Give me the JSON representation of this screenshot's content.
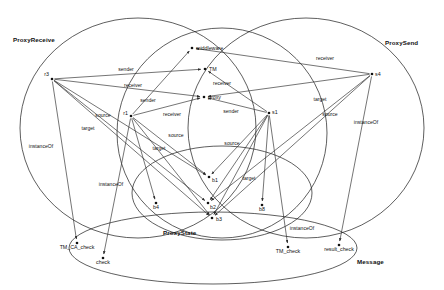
{
  "diagram": {
    "background_color": "#ffffff",
    "stroke_color": "#1a1a1a",
    "width": 444,
    "height": 290,
    "classes": [
      {
        "id": "proxyreceive",
        "label": "ProxyReceive",
        "cx": 138,
        "cy": 128,
        "rx": 118,
        "ry": 110,
        "label_x": 13,
        "label_y": 42
      },
      {
        "id": "proxysend",
        "label": "ProxySend",
        "cx": 306,
        "cy": 128,
        "rx": 118,
        "ry": 110,
        "label_x": 385,
        "label_y": 45
      },
      {
        "id": "middle_ring",
        "label": "",
        "cx": 222,
        "cy": 133,
        "rx": 105,
        "ry": 105,
        "label_x": 0,
        "label_y": 0
      },
      {
        "id": "proxystate",
        "label": "ProxyState",
        "cx": 222,
        "cy": 193,
        "rx": 90,
        "ry": 47,
        "label_x": 163,
        "label_y": 235
      },
      {
        "id": "message",
        "label": "Message",
        "cx": 213,
        "cy": 248,
        "rx": 144,
        "ry": 36,
        "label_x": 357,
        "label_y": 264
      }
    ],
    "nodes": [
      {
        "id": "r3",
        "label": "r3",
        "x": 52,
        "y": 79,
        "label_dx": -3,
        "label_dy": -3.5,
        "anchor": "end"
      },
      {
        "id": "r1",
        "label": "r1",
        "x": 131,
        "y": 116,
        "label_dx": -3,
        "label_dy": -1,
        "anchor": "end"
      },
      {
        "id": "s4",
        "label": "s4",
        "x": 372,
        "y": 74,
        "label_dx": 3,
        "label_dy": 2,
        "anchor": "start"
      },
      {
        "id": "s1",
        "label": "s1",
        "x": 269,
        "y": 113,
        "label_dx": 3,
        "label_dy": 1,
        "anchor": "start"
      },
      {
        "id": "middleware",
        "label": "middleware",
        "x": 192,
        "y": 48,
        "label_dx": 4,
        "label_dy": 2,
        "anchor": "start"
      },
      {
        "id": "tm",
        "label": "TM",
        "x": 205,
        "y": 69,
        "label_dx": 4,
        "label_dy": 2,
        "anchor": "start"
      },
      {
        "id": "proxy",
        "label": "proxy",
        "x": 204,
        "y": 97,
        "label_dx": 4,
        "label_dy": 2,
        "anchor": "start"
      },
      {
        "id": "b1",
        "label": "b1",
        "x": 209,
        "y": 177,
        "label_dx": 3,
        "label_dy": 5,
        "anchor": "start"
      },
      {
        "id": "b2",
        "label": "b2",
        "x": 208,
        "y": 203,
        "label_dx": 2,
        "label_dy": 5.5,
        "anchor": "start"
      },
      {
        "id": "b3",
        "label": "b3",
        "x": 212,
        "y": 218,
        "label_dx": 4,
        "label_dy": 3,
        "anchor": "start"
      },
      {
        "id": "b4",
        "label": "b4",
        "x": 156,
        "y": 203,
        "label_dx": 0,
        "label_dy": 6,
        "anchor": "middle"
      },
      {
        "id": "b8",
        "label": "b8",
        "x": 262,
        "y": 205,
        "label_dx": 0,
        "label_dy": 6,
        "anchor": "middle"
      },
      {
        "id": "tm_ca_check",
        "label": "TM_CA_check",
        "x": 77,
        "y": 243,
        "label_dx": 0,
        "label_dy": 6,
        "anchor": "middle"
      },
      {
        "id": "check",
        "label": "check",
        "x": 103,
        "y": 258,
        "label_dx": 0,
        "label_dy": 6,
        "anchor": "middle"
      },
      {
        "id": "tm_check",
        "label": "TM_check",
        "x": 288,
        "y": 247,
        "label_dx": 0,
        "label_dy": 6,
        "anchor": "middle"
      },
      {
        "id": "result_check",
        "label": "result_check",
        "x": 339,
        "y": 245,
        "label_dx": 0,
        "label_dy": 6,
        "anchor": "middle"
      }
    ],
    "edges": [
      {
        "id": "e1",
        "from": "r3",
        "to": "tm",
        "label": "sender",
        "lx": 126,
        "ly": 71,
        "bend": 0
      },
      {
        "id": "e2",
        "from": "r3",
        "to": "proxy",
        "label": "receiver",
        "lx": 133,
        "ly": 87,
        "bend": 0
      },
      {
        "id": "e3",
        "from": "r3",
        "to": "b3",
        "label": "source",
        "lx": 103,
        "ly": 117,
        "bend": 0
      },
      {
        "id": "e4",
        "from": "r3",
        "to": "b2",
        "label": "target",
        "lx": 88,
        "ly": 130,
        "bend": 0
      },
      {
        "id": "e5",
        "from": "r3",
        "to": "tm_ca_check",
        "label": "instanceOf",
        "lx": 41,
        "ly": 148,
        "bend": 0
      },
      {
        "id": "e6",
        "from": "r1",
        "to": "middleware",
        "label": "sender",
        "lx": 148,
        "ly": 102,
        "bend": 0
      },
      {
        "id": "e7",
        "from": "r1",
        "to": "proxy",
        "label": "receiver",
        "lx": 172,
        "ly": 116,
        "bend": 0
      },
      {
        "id": "e8",
        "from": "r1",
        "to": "b3",
        "label": "source",
        "lx": 176,
        "ly": 137,
        "bend": 0
      },
      {
        "id": "e9",
        "from": "r1",
        "to": "b1",
        "label": "target",
        "lx": 159,
        "ly": 150,
        "bend": 0
      },
      {
        "id": "e10",
        "from": "r1",
        "to": "check",
        "label": "instanceOf",
        "lx": 111,
        "ly": 186,
        "bend": 0
      },
      {
        "id": "e11",
        "from": "s4",
        "to": "middleware",
        "label": "receiver",
        "lx": 325,
        "ly": 60,
        "bend": 0
      },
      {
        "id": "e12",
        "from": "s4",
        "to": "proxy",
        "label": "",
        "lx": 330,
        "ly": 82,
        "bend": 0
      },
      {
        "id": "e13",
        "from": "s4",
        "to": "b3",
        "label": "target",
        "lx": 320,
        "ly": 101,
        "bend": 0
      },
      {
        "id": "e14",
        "from": "s4",
        "to": "b2",
        "label": "source",
        "lx": 330,
        "ly": 116,
        "bend": 0
      },
      {
        "id": "e15",
        "from": "s4",
        "to": "result_check",
        "label": "instanceOf",
        "lx": 366,
        "ly": 124,
        "bend": 0
      },
      {
        "id": "e16",
        "from": "s1",
        "to": "tm",
        "label": "receiver",
        "lx": 222,
        "ly": 85,
        "bend": 0
      },
      {
        "id": "e17",
        "from": "s1",
        "to": "proxy",
        "label": "sender",
        "lx": 231,
        "ly": 113,
        "bend": 0
      },
      {
        "id": "e18",
        "from": "s1",
        "to": "b3",
        "label": "source",
        "lx": 232,
        "ly": 145,
        "bend": 0
      },
      {
        "id": "e19",
        "from": "s1",
        "to": "b2",
        "label": "target",
        "lx": 249,
        "ly": 180,
        "bend": 0
      },
      {
        "id": "e20",
        "from": "s1",
        "to": "b1",
        "label": "",
        "lx": 0,
        "ly": 0,
        "bend": 0
      },
      {
        "id": "e21",
        "from": "s1",
        "to": "b8",
        "label": "",
        "lx": 0,
        "ly": 0,
        "bend": 0
      },
      {
        "id": "e22",
        "from": "s1",
        "to": "tm_check",
        "label": "instanceOf",
        "lx": 302,
        "ly": 230,
        "bend": 0
      },
      {
        "id": "e23",
        "from": "r1",
        "to": "b4",
        "label": "",
        "lx": 0,
        "ly": 0,
        "bend": 0
      },
      {
        "id": "e24",
        "from": "r3",
        "to": "b1",
        "label": "",
        "lx": 0,
        "ly": 0,
        "bend": 0
      }
    ]
  }
}
